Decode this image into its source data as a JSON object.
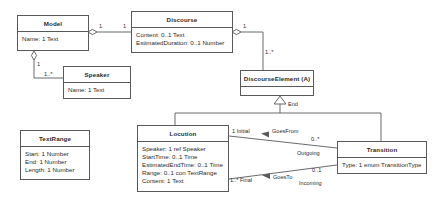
{
  "diagram": {
    "type": "uml-class-diagram",
    "classes": [
      {
        "id": "model",
        "name": "Model",
        "attributes": [
          "Name: 1 Text"
        ]
      },
      {
        "id": "discourse",
        "name": "Discourse",
        "attributes": [
          "Content: 0..1 Text",
          "EstimatedDuration: 0..1 Number"
        ]
      },
      {
        "id": "speaker",
        "name": "Speaker",
        "attributes": [
          "Name: 1 Text"
        ]
      },
      {
        "id": "discourse-element",
        "name": "DiscourseElement (A)",
        "attributes": []
      },
      {
        "id": "text-range",
        "name": "TextRange",
        "attributes": [
          "Start: 1 Number",
          "End: 1 Number",
          "Length: 1 Number"
        ]
      },
      {
        "id": "locution",
        "name": "Locution",
        "attributes": [
          "Speaker: 1 ref Speaker",
          "StartTime: 0..1 Time",
          "EstimatedEndTime: 0..1 Time",
          "Range: 0..1 con TextRange",
          "Content: 1 Text"
        ]
      },
      {
        "id": "transition",
        "name": "Transition",
        "attributes": [
          "Type: 1 enum TransitionType"
        ]
      }
    ],
    "edge_labels": {
      "model_end": "1",
      "discourse_end": "1",
      "model_speaker_source": "1",
      "model_speaker_target": "1..*",
      "discourse_de_source": "1",
      "discourse_de_target": "1..*",
      "generalization_role": "End",
      "goes_from_name": "GoesFrom",
      "goes_from_source": "1 Initial",
      "goes_from_target": "0..*",
      "goes_from_role": "Outgoing",
      "goes_to_name": "GoesTo",
      "goes_to_source": "1..* Final",
      "goes_to_target": "0..1",
      "goes_to_role": "Incoming"
    },
    "colors": {
      "stroke": "#58595b",
      "text": "#2b2b2b",
      "background": "#ffffff"
    }
  }
}
